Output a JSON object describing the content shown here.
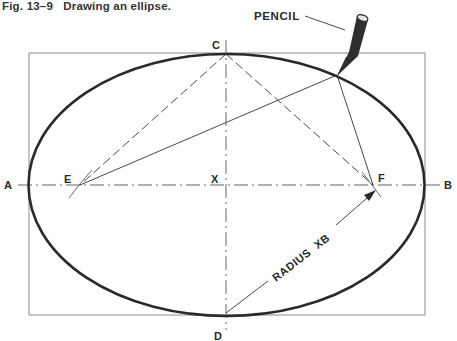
{
  "figure": {
    "caption": "Fig. 13–9   Drawing an ellipse.",
    "labels": {
      "A": "A",
      "B": "B",
      "C": "C",
      "D": "D",
      "E": "E",
      "F": "F",
      "X": "X",
      "pencil": "PENCIL",
      "radius": "RADIUS  XB"
    },
    "colors": {
      "ink": "#2a2a2a",
      "frame": "#8a8a8a",
      "background": "#ffffff"
    }
  }
}
